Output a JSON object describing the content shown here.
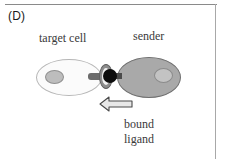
{
  "panel": {
    "letter": "(D)",
    "background_color": "#ffffff",
    "border_color": "#8a8a8a"
  },
  "labels": {
    "target_cell": "target cell",
    "sender": "sender",
    "bound_ligand_line1": "bound",
    "bound_ligand_line2": "ligand",
    "text_color": "#3a3a3a"
  },
  "diagram": {
    "target_cell": {
      "name": "target cell",
      "fill_color": "#fbfbfb",
      "outline_color": "#b6b6b6",
      "nucleus_fill": "#bdbdbd"
    },
    "sender_cell": {
      "name": "sender",
      "fill_color": "#a9a9a9",
      "outline_color": "#6f6f6f",
      "nucleus_fill": "#c3c3c3"
    },
    "receptor": {
      "name": "receptor",
      "stalk_color": "#6b6b6b",
      "collar_color": "#8d8d8d"
    },
    "bound_ligand": {
      "name": "bound ligand",
      "dot_color": "#0d0d0d",
      "stalk_color": "#4a4a4a"
    },
    "arrow": {
      "name": "bound ligand pointer",
      "direction": "left",
      "fill_color": "#e8e8e8",
      "outline_color": "#4a4a4a"
    }
  }
}
